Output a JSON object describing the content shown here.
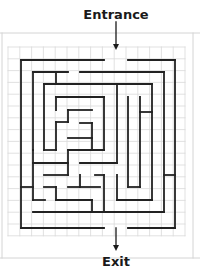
{
  "labels": {
    "entrance": "Entrance",
    "exit": "Exit"
  },
  "colors": {
    "wall": "#222222",
    "grid": "#d9d9d9",
    "frame": "#d4d4d4",
    "arrow": "#1a1a1a"
  },
  "grid": {
    "x0": 8,
    "y0": 47,
    "cell": 11.8,
    "cols": 15,
    "rows": 16
  },
  "frame": {
    "top_y": 33,
    "bottom_y": 258,
    "left_x": 2,
    "right_x": 193
  },
  "arrows": {
    "entrance": {
      "x": 116,
      "y1": 22,
      "y2": 50
    },
    "exit": {
      "x": 116,
      "y1": 228,
      "y2": 251
    }
  },
  "walls": [
    [
      21,
      60,
      104,
      60
    ],
    [
      128,
      60,
      175,
      60
    ],
    [
      21,
      60,
      21,
      228
    ],
    [
      175,
      60,
      175,
      228
    ],
    [
      21,
      228,
      104,
      228
    ],
    [
      128,
      228,
      175,
      228
    ],
    [
      33,
      72,
      68,
      72
    ],
    [
      80,
      72,
      164,
      72
    ],
    [
      33,
      72,
      33,
      150
    ],
    [
      56,
      72,
      56,
      84
    ],
    [
      164,
      72,
      164,
      212
    ],
    [
      44,
      84,
      152,
      84
    ],
    [
      44,
      84,
      44,
      150
    ],
    [
      152,
      84,
      152,
      200
    ],
    [
      117,
      84,
      117,
      163
    ],
    [
      56,
      97,
      104,
      97
    ],
    [
      56,
      97,
      56,
      110
    ],
    [
      104,
      97,
      104,
      150
    ],
    [
      128,
      97,
      128,
      187
    ],
    [
      140,
      97,
      140,
      187
    ],
    [
      128,
      187,
      140,
      187
    ],
    [
      140,
      112,
      152,
      112
    ],
    [
      68,
      110,
      92,
      110
    ],
    [
      68,
      110,
      68,
      122
    ],
    [
      56,
      122,
      68,
      122
    ],
    [
      56,
      122,
      56,
      150
    ],
    [
      80,
      123,
      92,
      123
    ],
    [
      92,
      123,
      92,
      150
    ],
    [
      68,
      138,
      92,
      138
    ],
    [
      44,
      150,
      56,
      150
    ],
    [
      68,
      150,
      104,
      150
    ],
    [
      68,
      150,
      68,
      175
    ],
    [
      33,
      150,
      33,
      200
    ],
    [
      33,
      163,
      68,
      163
    ],
    [
      80,
      163,
      117,
      163
    ],
    [
      44,
      175,
      68,
      175
    ],
    [
      80,
      175,
      80,
      187
    ],
    [
      80,
      187,
      100,
      187
    ],
    [
      95,
      175,
      104,
      175
    ],
    [
      104,
      175,
      104,
      212
    ],
    [
      21,
      187,
      33,
      187
    ],
    [
      44,
      187,
      56,
      187
    ],
    [
      56,
      187,
      56,
      200
    ],
    [
      68,
      187,
      80,
      187
    ],
    [
      33,
      200,
      45,
      200
    ],
    [
      56,
      200,
      92,
      200
    ],
    [
      92,
      200,
      92,
      212
    ],
    [
      117,
      175,
      117,
      200
    ],
    [
      117,
      200,
      152,
      200
    ],
    [
      164,
      175,
      175,
      175
    ],
    [
      33,
      212,
      164,
      212
    ]
  ]
}
